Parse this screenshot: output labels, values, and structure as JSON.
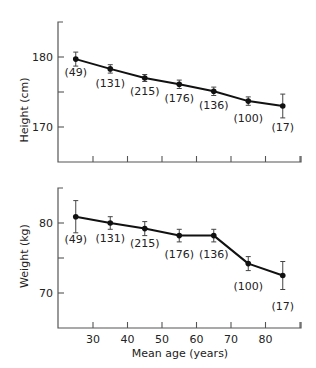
{
  "chart_data": [
    {
      "type": "line",
      "title": "",
      "xlabel": "",
      "ylabel": "Height (cm)",
      "x": [
        25,
        35,
        45,
        55,
        65,
        75,
        85
      ],
      "values": [
        179.7,
        178.3,
        177.0,
        176.1,
        175.1,
        173.7,
        173.0
      ],
      "error": [
        1.0,
        0.6,
        0.5,
        0.6,
        0.6,
        0.6,
        1.7
      ],
      "n_labels": [
        "(49)",
        "(131)",
        "(215)",
        "(176)",
        "(136)",
        "(100)",
        "(17)"
      ],
      "yticks": [
        {
          "value": 170,
          "label": "170"
        },
        {
          "value": 175,
          "label": ""
        },
        {
          "value": 180,
          "label": "180"
        }
      ],
      "ylim": [
        165,
        185
      ],
      "xlim": [
        20,
        90
      ],
      "xticks": [
        30,
        40,
        50,
        60,
        70,
        80,
        90
      ],
      "show_xtick_labels": false,
      "grid": false
    },
    {
      "type": "line",
      "title": "",
      "xlabel": "Mean age (years)",
      "ylabel": "Weight (kg)",
      "x": [
        25,
        35,
        45,
        55,
        65,
        75,
        85
      ],
      "values": [
        80.9,
        80.0,
        79.2,
        78.2,
        78.2,
        74.2,
        72.5
      ],
      "error": [
        2.3,
        0.9,
        1.0,
        0.9,
        0.9,
        1.0,
        2.0
      ],
      "n_labels": [
        "(49)",
        "(131)",
        "(215)",
        "(176)",
        "(136)",
        "(100)",
        "(17)"
      ],
      "yticks": [
        {
          "value": 70,
          "label": "70"
        },
        {
          "value": 75,
          "label": ""
        },
        {
          "value": 80,
          "label": "80"
        }
      ],
      "ylim": [
        65,
        85
      ],
      "xlim": [
        20,
        90
      ],
      "xticks": [
        30,
        40,
        50,
        60,
        70,
        80,
        90
      ],
      "xtick_labels": [
        "30",
        "40",
        "50",
        "60",
        "70",
        "80",
        ""
      ],
      "show_xtick_labels": true,
      "grid": false
    }
  ],
  "labels": {
    "top_ylabel": "Height (cm)",
    "bottom_ylabel": "Weight (kg)",
    "xlabel": "Mean age (years)"
  }
}
